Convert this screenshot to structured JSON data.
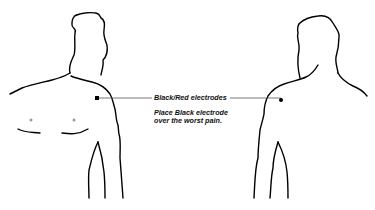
{
  "diagram": {
    "electrode_label": "Black/Red electrodes",
    "instruction_line1": "Place Black electrode",
    "instruction_line2": "over the worst pain.",
    "figures": [
      "front-view-torso",
      "back-view-torso"
    ],
    "colors": {
      "outline": "#000000",
      "leader_line": "#555555",
      "electrode_dot": "#000000",
      "nipple_dot": "#999999"
    }
  }
}
